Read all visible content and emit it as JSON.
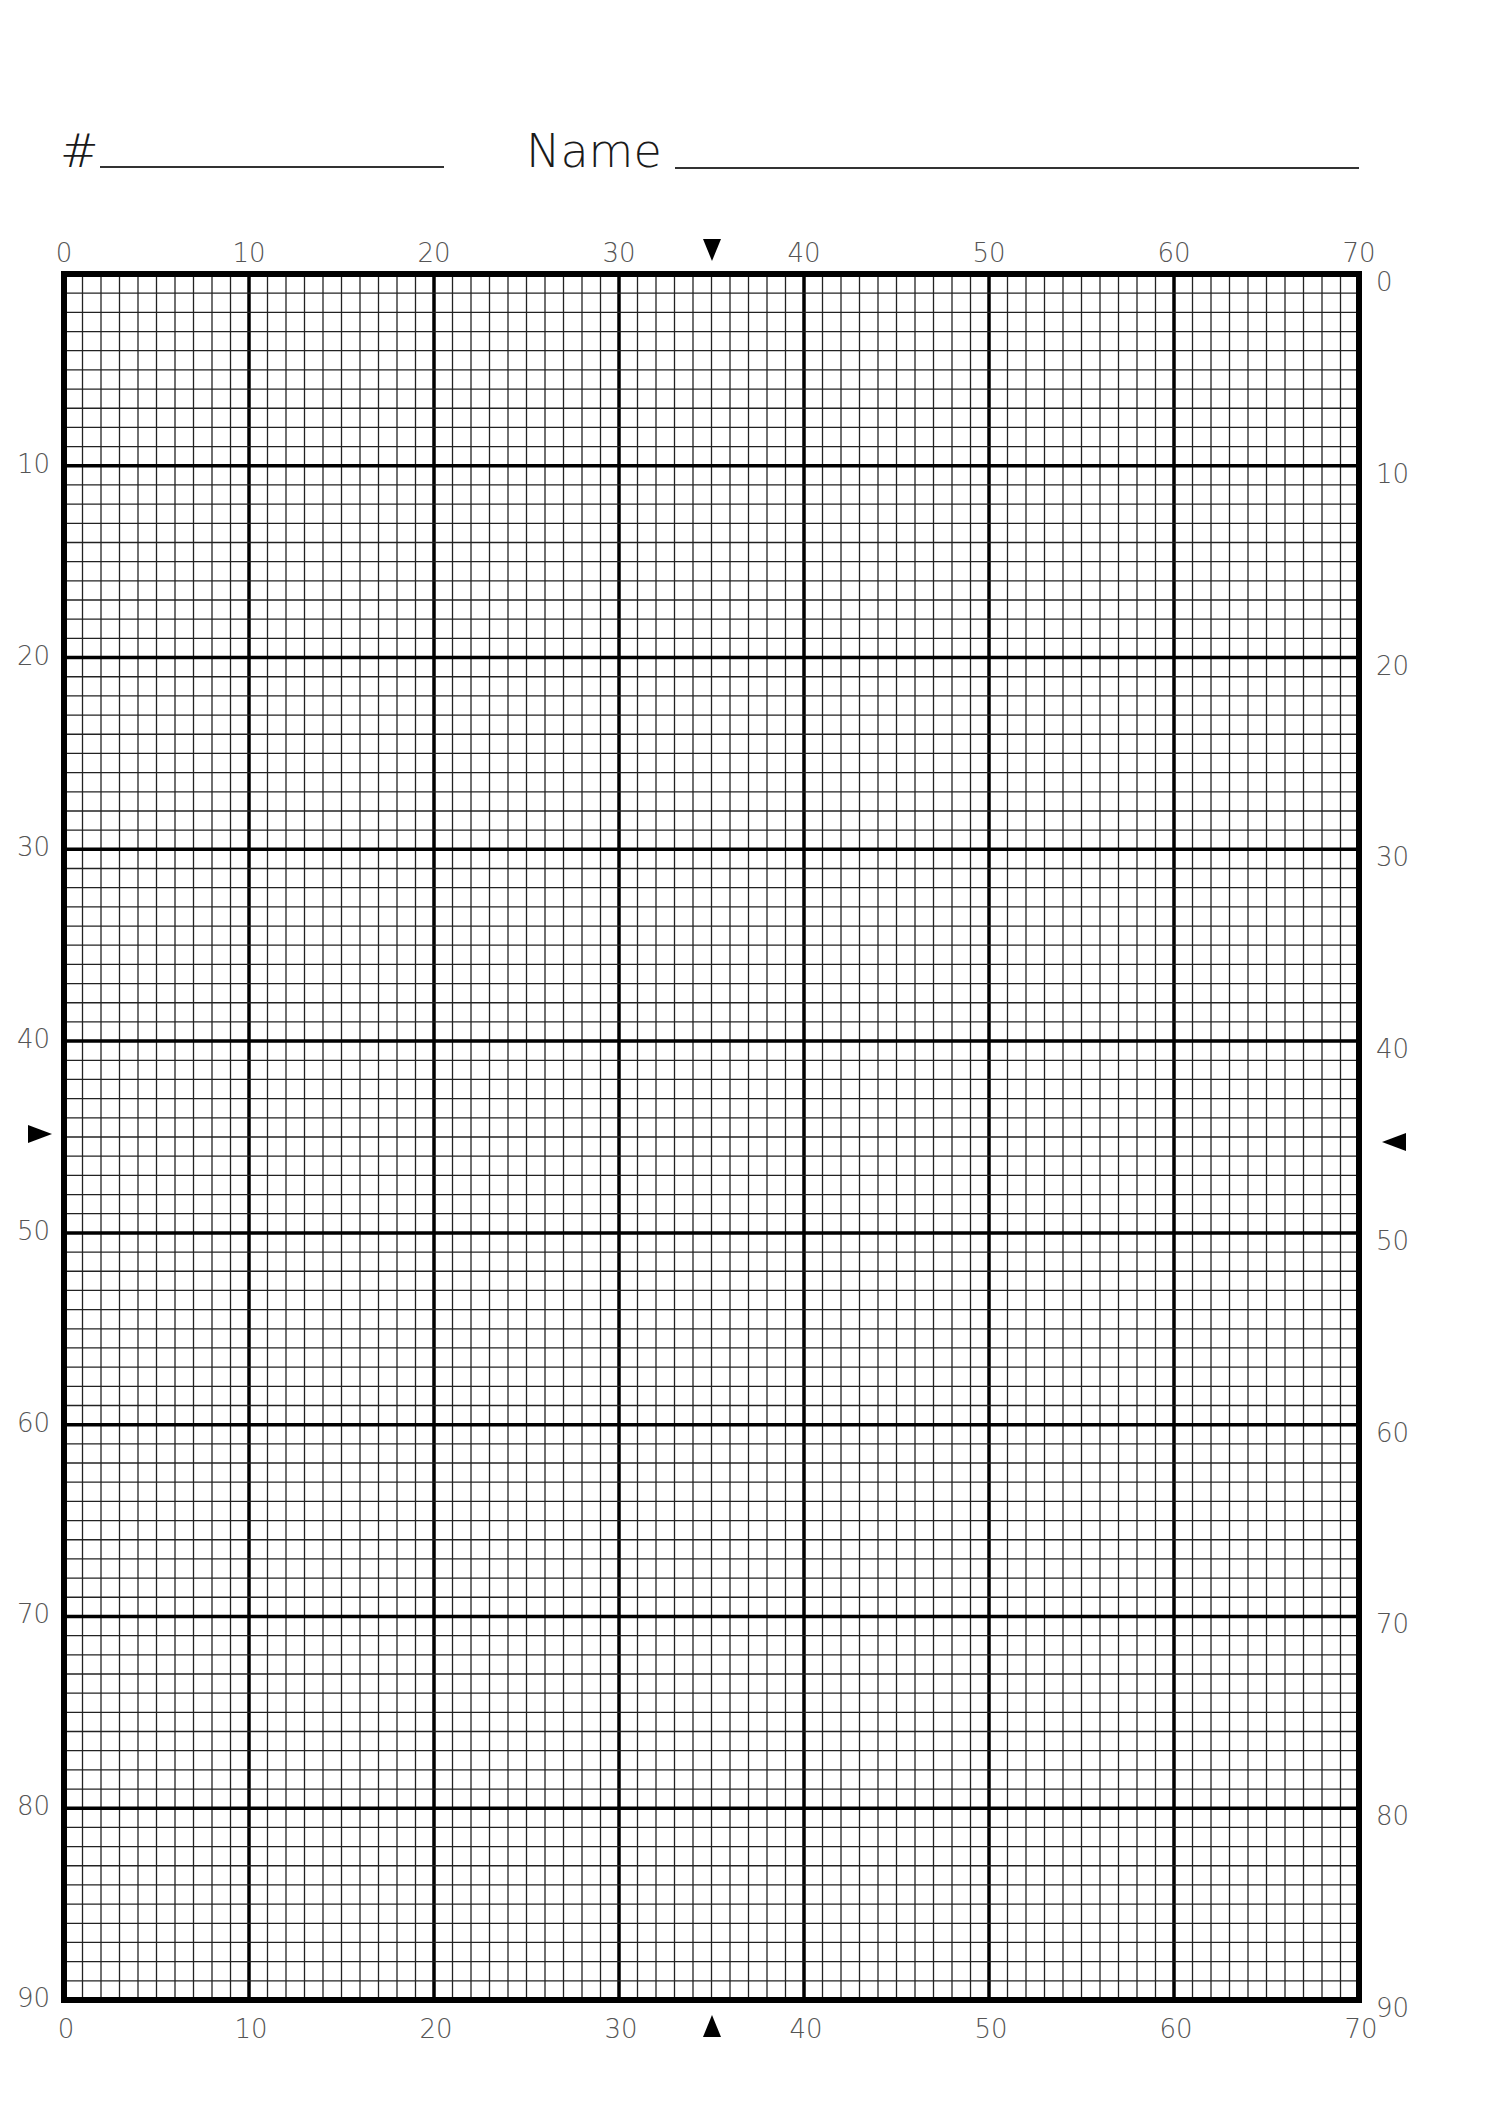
{
  "header": {
    "number_label": "#",
    "number_value": "",
    "name_label": "Name",
    "name_value": ""
  },
  "grid": {
    "columns": 70,
    "rows": 90,
    "major_every": 10,
    "colors": {
      "line": "#222222",
      "major": "#000000",
      "border": "#000000",
      "label": "#555555"
    }
  },
  "axes": {
    "top_labels": [
      "0",
      "10",
      "20",
      "30",
      "40",
      "50",
      "60",
      "70"
    ],
    "bottom_labels": [
      "0",
      "10",
      "20",
      "30",
      "40",
      "50",
      "60",
      "70"
    ],
    "left_labels": [
      "10",
      "20",
      "30",
      "40",
      "50",
      "60",
      "70",
      "80",
      "90"
    ],
    "right_labels": [
      "0",
      "10",
      "20",
      "30",
      "40",
      "50",
      "60",
      "70",
      "80",
      "90"
    ]
  },
  "markers": {
    "top": {
      "direction": "down",
      "position": 35
    },
    "bottom": {
      "direction": "up",
      "position": 35
    },
    "left": {
      "direction": "right",
      "position": 45
    },
    "right": {
      "direction": "left",
      "position": 45
    }
  }
}
